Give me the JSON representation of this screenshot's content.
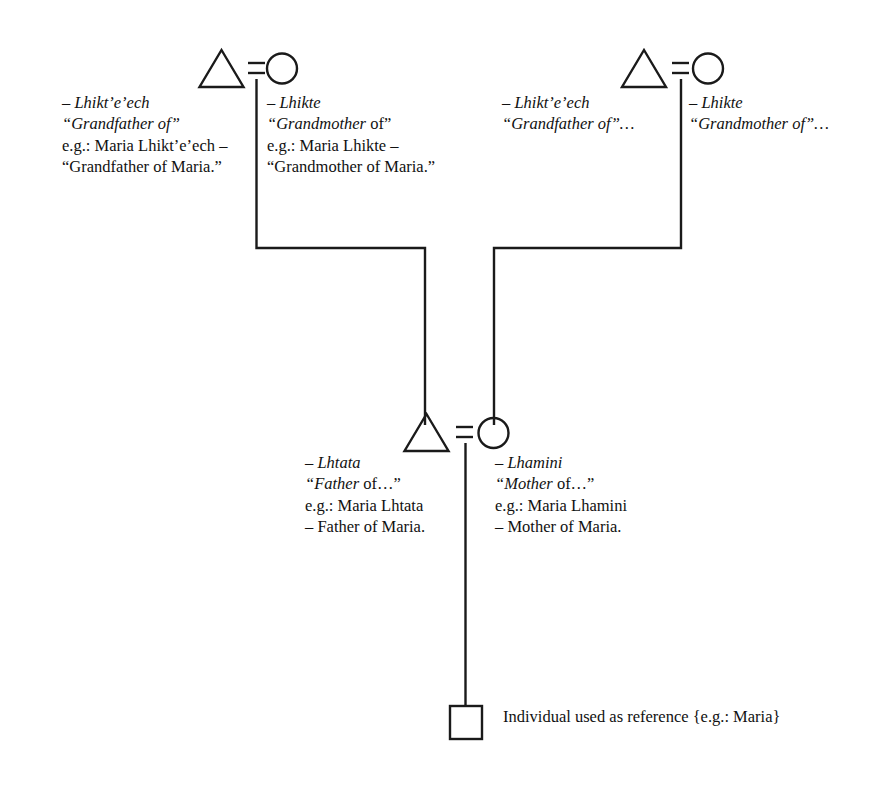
{
  "diagram": {
    "type": "kinship-chart",
    "line_color": "#1a1a1a",
    "background_color": "#ffffff",
    "symbols": {
      "male": "triangle",
      "female": "circle",
      "reference": "square",
      "marriage": "equals-sign"
    }
  },
  "nodes": {
    "grandfather_left": {
      "symbol": "triangle",
      "term": "– Lhikt’e’ech",
      "gloss": "“Grandfather of”",
      "example_line1": "e.g.: Maria Lhikt’e’ech –",
      "example_line2": "“Grandfather of Maria.”"
    },
    "grandmother_left": {
      "symbol": "circle",
      "term": "– Lhikte",
      "gloss_italic": "“Grandmother",
      "gloss_rest": " of”",
      "example_line1": "e.g.: Maria Lhikte –",
      "example_line2": "“Grandmother of Maria.”"
    },
    "grandfather_right": {
      "symbol": "triangle",
      "term": "– Lhikt’e’ech",
      "gloss_italic": "“Grandfather",
      "gloss_rest": " of”…"
    },
    "grandmother_right": {
      "symbol": "circle",
      "term": "– Lhikte",
      "gloss_italic": "“Grandmother",
      "gloss_rest": " of”…"
    },
    "father": {
      "symbol": "triangle",
      "term": "– Lhtata",
      "gloss_italic": "“Father",
      "gloss_rest": " of…”",
      "example_line1": "e.g.: Maria Lhtata",
      "example_line2": "– Father of Maria."
    },
    "mother": {
      "symbol": "circle",
      "term": "– Lhamini",
      "gloss_italic": "“Mother",
      "gloss_rest": " of…”",
      "example_line1": "e.g.: Maria Lhamini",
      "example_line2": "– Mother of Maria."
    },
    "reference_individual": {
      "symbol": "square",
      "legend_line1": "Individual used as reference",
      "legend_line2": "{e.g.: Maria}"
    }
  }
}
